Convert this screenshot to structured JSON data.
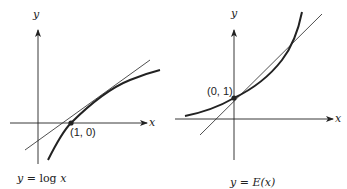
{
  "figure": {
    "left_graph": {
      "y_axis_label": "y",
      "x_axis_label": "x",
      "point_label": "(1, 0)",
      "caption": {
        "lhs": "y",
        "eq": " = ",
        "fn": "log ",
        "arg": "x"
      }
    },
    "right_graph": {
      "y_axis_label": "y",
      "x_axis_label": "x",
      "point_label": "(0, 1)",
      "caption": {
        "lhs": "y",
        "eq": " = ",
        "fn": "E",
        "arg": "(x)"
      }
    },
    "colors": {
      "ink": "#222222",
      "background": "#ffffff"
    }
  }
}
